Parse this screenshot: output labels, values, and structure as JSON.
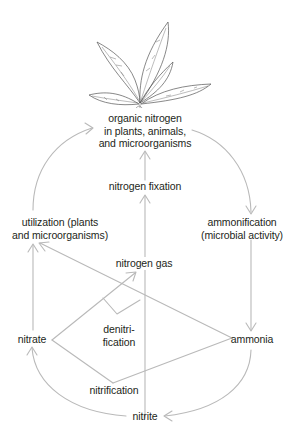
{
  "diagram": {
    "colors": {
      "line": "#b9b9b9",
      "plant": "#555555",
      "text": "#231f20",
      "background": "#ffffff"
    },
    "nodes": {
      "organic_nitrogen": {
        "line1": "organic nitrogen",
        "line2": "in plants, animals,",
        "line3": "and microorganisms"
      },
      "nitrogen_fixation": "nitrogen fixation",
      "utilization": {
        "line1": "utilization (plants",
        "line2": "and microorganisms)"
      },
      "ammonification": {
        "line1": "ammonification",
        "line2": "(microbial activity)"
      },
      "nitrogen_gas": "nitrogen gas",
      "denitrification": {
        "line1": "denitri-",
        "line2": "fication"
      },
      "nitrate": "nitrate",
      "ammonia": "ammonia",
      "nitrification": "nitrification",
      "nitrite": "nitrite"
    },
    "edges": [
      {
        "from": "utilization",
        "to": "organic nitrogen"
      },
      {
        "from": "organic nitrogen",
        "to": "ammonification"
      },
      {
        "from": "nitrogen fixation",
        "to": "organic nitrogen"
      },
      {
        "from": "nitrite",
        "to": "nitrogen fixation"
      },
      {
        "from": "ammonification",
        "to": "ammonia"
      },
      {
        "from": "ammonia",
        "to": "utilization"
      },
      {
        "from": "nitrate",
        "to": "utilization"
      },
      {
        "from": "nitrate",
        "to": "nitrogen gas"
      },
      {
        "from": "ammonia",
        "to": "nitrite"
      },
      {
        "from": "nitrite",
        "to": "nitrate"
      }
    ],
    "icon": "plant-sprout-icon"
  }
}
